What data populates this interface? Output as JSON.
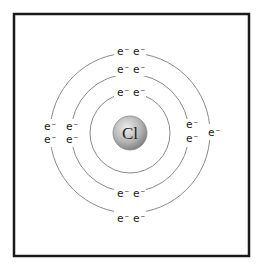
{
  "diagram": {
    "nucleus": {
      "symbol": "Cl",
      "fill_light": "#e6e6e6",
      "fill_dark": "#8c8c8c"
    },
    "electron_label": "e⁻",
    "shells": [
      {
        "name": "shell-1",
        "radius": 40,
        "electrons": 2
      },
      {
        "name": "shell-2",
        "radius": 59,
        "electrons": 8
      },
      {
        "name": "shell-3",
        "radius": 80,
        "electrons": 7
      }
    ],
    "colors": {
      "frame": "#1a1a1a",
      "orbit": "#8a8a8a",
      "text": "#222222"
    }
  }
}
